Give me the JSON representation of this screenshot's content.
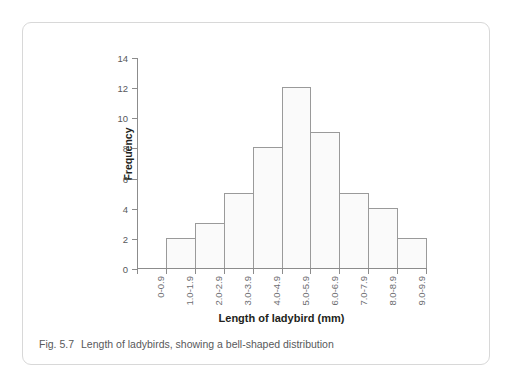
{
  "figure": {
    "caption_label": "Fig. 5.7",
    "caption_text": "Length of ladybirds, showing a bell-shaped distribution"
  },
  "chart_data": {
    "type": "bar",
    "title": "",
    "subtitle": "",
    "xlabel": "Length of ladybird (mm)",
    "ylabel": "Frequency",
    "categories": [
      "0-0.9",
      "1.0-1.9",
      "2.0-2.9",
      "3.0-3.9",
      "4.0-4.9",
      "5.0-5.9",
      "6.0-6.9",
      "7.0-7.9",
      "8.0-8.9",
      "9.0-9.9"
    ],
    "values": [
      0,
      2,
      3,
      5,
      8,
      12,
      9,
      5,
      4,
      2
    ],
    "ylim": [
      0,
      14
    ],
    "ytick_labels": [
      "0",
      "2",
      "4",
      "6",
      "8",
      "10",
      "12",
      "14"
    ],
    "ytick_values": [
      0,
      2,
      4,
      6,
      8,
      10,
      12,
      14
    ],
    "grid": false,
    "legend": false,
    "legend_position": "none",
    "bar_fill_color": "#fafafa",
    "bar_stroke_color": "#9a9a9a",
    "axis_color": "#8c8c8c",
    "tick_label_color": "#6d6e71",
    "axis_title_color": "#231f20"
  }
}
